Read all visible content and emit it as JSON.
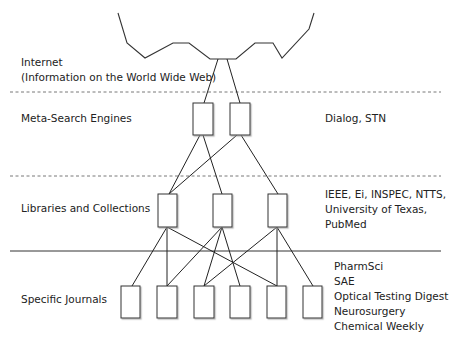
{
  "layers": [
    {
      "name": "Internet",
      "label_lines": [
        "Internet",
        "(Information on the World Wide Web)"
      ],
      "examples": []
    },
    {
      "name": "Meta-Search Engines",
      "label_lines": [
        "Meta-Search Engines"
      ],
      "examples": [
        "Dialog, STN"
      ]
    },
    {
      "name": "Libraries and Collections",
      "label_lines": [
        "Libraries and Collections"
      ],
      "examples": [
        "IEEE, Ei, INSPEC, NTTS,",
        "University of Texas,",
        "PubMed"
      ]
    },
    {
      "name": "Specific Journals",
      "label_lines": [
        "Specific Journals"
      ],
      "examples": [
        "PharmSci",
        "SAE",
        "Optical Testing Digest",
        "Neurosurgery",
        "Chemical Weekly"
      ]
    }
  ],
  "separators": [
    {
      "between": "Internet / Meta-Search Engines",
      "style": "dashed"
    },
    {
      "between": "Meta-Search Engines / Libraries and Collections",
      "style": "dashed"
    },
    {
      "between": "Libraries and Collections / Specific Journals",
      "style": "solid"
    }
  ],
  "nodes": {
    "meta_search": 2,
    "libraries": 3,
    "journals": 6
  },
  "edges": {
    "internet_to_meta": [
      [
        0,
        0
      ],
      [
        0,
        1
      ]
    ],
    "meta_to_libraries": [
      [
        0,
        0
      ],
      [
        0,
        1
      ],
      [
        1,
        0
      ],
      [
        1,
        2
      ]
    ],
    "libraries_to_journals": [
      [
        0,
        0
      ],
      [
        0,
        1
      ],
      [
        0,
        4
      ],
      [
        1,
        1
      ],
      [
        1,
        2
      ],
      [
        1,
        3
      ],
      [
        2,
        2
      ],
      [
        2,
        4
      ],
      [
        2,
        5
      ]
    ]
  },
  "colors": {
    "line": "#222222",
    "box_fill": "#ffffff",
    "shadow": "#bbbbbb"
  }
}
